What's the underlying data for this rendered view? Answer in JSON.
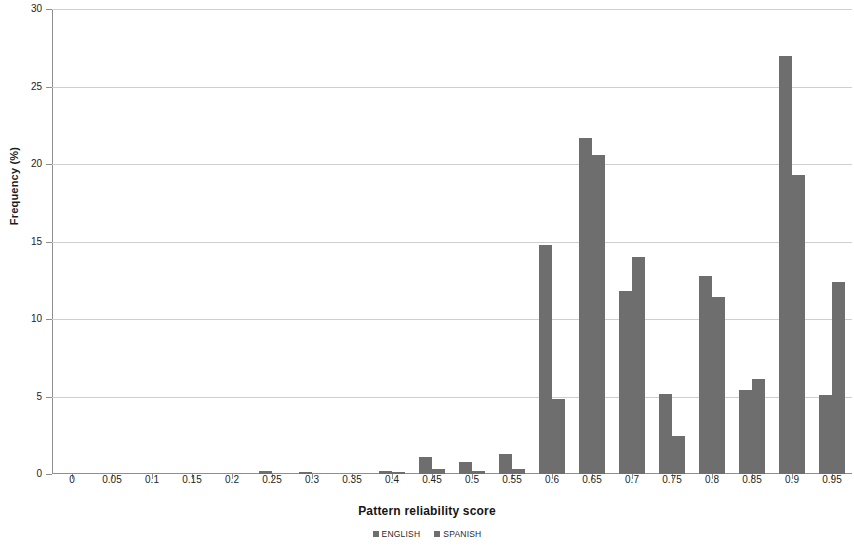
{
  "chart_data": {
    "type": "bar",
    "title": "",
    "xlabel": "Pattern reliability score",
    "ylabel": "Frequency (%)",
    "ylim": [
      0,
      30
    ],
    "yticks": [
      0,
      5,
      10,
      15,
      20,
      25,
      30
    ],
    "ytick_labels": [
      "0",
      "5",
      "10",
      "15",
      "20",
      "25",
      "30"
    ],
    "grid": true,
    "legend_position": "bottom",
    "bar_color": "#6e6e6e",
    "categories": [
      "0",
      "0.05",
      "0.1",
      "0.15",
      "0.2",
      "0.25",
      "0.3",
      "0.35",
      "0.4",
      "0.45",
      "0.5",
      "0.55",
      "0.6",
      "0.65",
      "0.7",
      "0.75",
      "0.8",
      "0.85",
      "0.9",
      "0.95"
    ],
    "series": [
      {
        "name": "ENGLISH",
        "color": "#6e6e6e",
        "values": [
          0,
          0,
          0,
          0,
          0,
          0.2,
          0.15,
          0,
          0.2,
          1.1,
          0.75,
          1.3,
          14.8,
          21.7,
          11.8,
          5.15,
          12.8,
          5.4,
          27.0,
          5.1
        ]
      },
      {
        "name": "SPANISH",
        "color": "#6e6e6e",
        "values": [
          0,
          0,
          0,
          0,
          0,
          0,
          0,
          0,
          0.1,
          0.3,
          0.2,
          0.35,
          4.85,
          20.6,
          14.0,
          2.45,
          11.4,
          6.1,
          19.3,
          12.4
        ]
      }
    ]
  }
}
